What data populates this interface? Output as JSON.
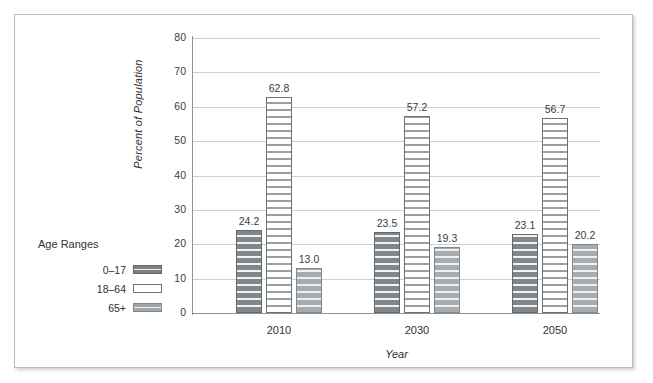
{
  "chart_data": {
    "type": "bar",
    "title": "",
    "xlabel": "Year",
    "ylabel": "Percent of Population",
    "categories": [
      "2010",
      "2030",
      "2050"
    ],
    "series": [
      {
        "name": "0–17",
        "values": [
          24.2,
          23.5,
          23.1
        ]
      },
      {
        "name": "18–64",
        "values": [
          62.8,
          57.2,
          56.7
        ]
      },
      {
        "name": "65+",
        "values": [
          13.0,
          19.3,
          20.2
        ]
      }
    ],
    "value_labels": [
      [
        "24.2",
        "23.5",
        "23.1"
      ],
      [
        "62.8",
        "57.2",
        "56.7"
      ],
      [
        "13.0",
        "19.3",
        "20.2"
      ]
    ],
    "ylim": [
      0,
      80
    ],
    "yticks": [
      0,
      10,
      20,
      30,
      40,
      50,
      60,
      70,
      80
    ],
    "ytick_labels": [
      "0",
      "10",
      "20",
      "30",
      "40",
      "50",
      "60",
      "70",
      "80"
    ],
    "grid": true,
    "legend_position": "left-outside"
  },
  "legend": {
    "title": "Age Ranges",
    "items": [
      {
        "label": "0–17",
        "swatch": "dark-gray-striped"
      },
      {
        "label": "18–64",
        "swatch": "white"
      },
      {
        "label": "65+",
        "swatch": "light-gray-striped"
      }
    ]
  },
  "colors": {
    "series0": "#82878b",
    "series1": "#ffffff",
    "series2": "#a7acb0",
    "gridline": "#cdd0d2",
    "axis": "#8e9295",
    "text": "#2f3133",
    "frame": "#b9bcbe"
  }
}
